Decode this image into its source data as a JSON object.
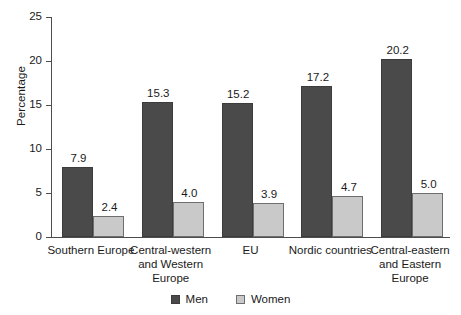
{
  "chart_data": {
    "type": "bar",
    "title": "",
    "subtitle": "",
    "xlabel": "",
    "ylabel": "Percentage",
    "ylim": [
      0,
      25
    ],
    "yticks": [
      0,
      5,
      10,
      15,
      20,
      25
    ],
    "ytick_labels": [
      "0",
      "5",
      "10",
      "15",
      "20",
      "25"
    ],
    "grid": false,
    "legend_position": "bottom-center",
    "categories": [
      "Southern Europe",
      "Central-western and Western Europe",
      "EU",
      "Nordic countries",
      "Central-eastern and Eastern Europe"
    ],
    "category_lines": [
      [
        "Southern Europe"
      ],
      [
        "Central-western",
        "and Western",
        "Europe"
      ],
      [
        "EU"
      ],
      [
        "Nordic countries"
      ],
      [
        "Central-eastern",
        "and Eastern",
        "Europe"
      ]
    ],
    "series": [
      {
        "name": "Men",
        "color": "#4a4a4a",
        "values": [
          7.9,
          15.3,
          15.2,
          17.2,
          20.2
        ],
        "labels": [
          "7.9",
          "15.3",
          "15.2",
          "17.2",
          "20.2"
        ]
      },
      {
        "name": "Women",
        "color": "#c9c9c9",
        "values": [
          2.4,
          4.0,
          3.9,
          4.7,
          5.0
        ],
        "labels": [
          "2.4",
          "4.0",
          "3.9",
          "4.7",
          "5.0"
        ]
      }
    ]
  },
  "legend": {
    "entries": [
      {
        "label": "Men",
        "swatch": "men-swatch"
      },
      {
        "label": "Women",
        "swatch": "women-swatch"
      }
    ]
  },
  "colors": {
    "men": "#4a4a4a",
    "women": "#c9c9c9",
    "axis": "#4d4d4d",
    "text": "#1a1a1a",
    "background": "#ffffff"
  }
}
